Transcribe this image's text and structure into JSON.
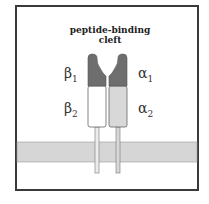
{
  "diagram": {
    "title_line1": "peptide-binding",
    "title_line2": "cleft",
    "labels": {
      "beta1": {
        "symbol": "β",
        "sub": "1"
      },
      "beta2": {
        "symbol": "β",
        "sub": "2"
      },
      "alpha1": {
        "symbol": "α",
        "sub": "1"
      },
      "alpha2": {
        "symbol": "α",
        "sub": "2"
      }
    },
    "colors": {
      "domain1": "#6e6e6e",
      "beta2": "#ffffff",
      "alpha2": "#d8d8d8",
      "membrane": "#d6d6d6",
      "outline": "#555555",
      "frame": "#3a3a3a"
    }
  }
}
